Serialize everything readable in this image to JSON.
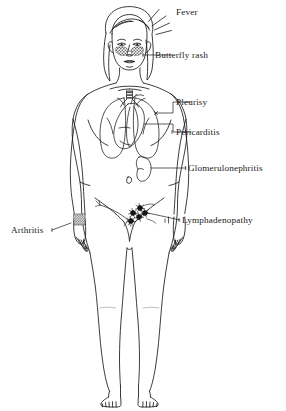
{
  "figure": {
    "stroke_color": "#1a1a1a",
    "background_color": "#ffffff",
    "text_color": "#1a1a1a"
  },
  "labels": {
    "fever": "Fever",
    "butterfly_rash": "Butterfly rash",
    "pleurisy": "Pleurisy",
    "pericarditis": "Pericarditis",
    "glomerulonephritis": "Glomerulonephritis",
    "lymphadenopathy": "Lymphadenopathy",
    "arthritis": "Arthritis"
  },
  "anatomy": {
    "head": "head-with-long-hair",
    "face": "face-with-eyes-nose-mouth",
    "cheeks": "butterfly-rash-stippled-cheeks",
    "lungs": "lungs-outline",
    "heart": "heart-with-chambers-and-great-vessels",
    "kidney": "kidney-outline",
    "lymph_nodes": "inguinal-lymph-node-cluster",
    "wrist": "stippled-wrist-joint",
    "navel": "navel",
    "legs": "legs-and-feet-with-toes"
  }
}
